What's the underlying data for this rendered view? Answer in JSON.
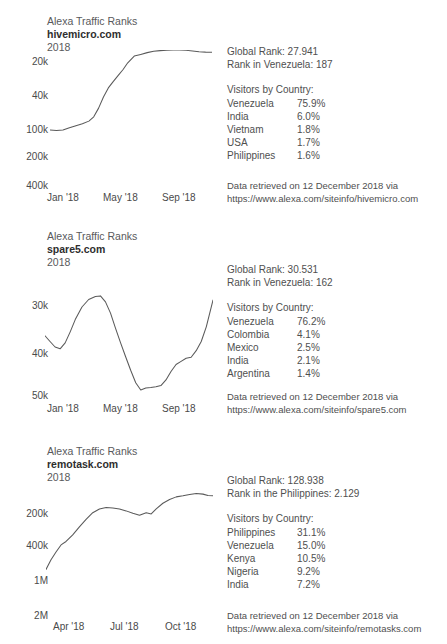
{
  "page": {
    "background": "#ffffff",
    "line_color": "#5a5a5a",
    "text_color": "#4f4f4f"
  },
  "panels": [
    {
      "kicker": "Alexa Traffic Ranks",
      "site": "hivemicro.com",
      "year": "2018",
      "global_rank_label": "Global Rank: 27.941",
      "country_rank_label": "Rank in Venezuela: 187",
      "visitors_title": "Visitors by Country:",
      "visitors": [
        {
          "country": "Venezuela",
          "pct": "75.9%"
        },
        {
          "country": "India",
          "pct": "6.0%"
        },
        {
          "country": "Vietnam",
          "pct": "1.8%"
        },
        {
          "country": "USA",
          "pct": "1.7%"
        },
        {
          "country": "Philippines",
          "pct": "1.6%"
        }
      ],
      "source_line1": "Data retrieved on 12 December 2018 via",
      "source_line2": "https://www.alexa.com/siteinfo/hivemicro.com"
    },
    {
      "kicker": "Alexa Traffic Ranks",
      "site": "spare5.com",
      "year": "2018",
      "global_rank_label": "Global Rank: 30.531",
      "country_rank_label": "Rank in Venezuela: 162",
      "visitors_title": "Visitors by Country:",
      "visitors": [
        {
          "country": "Venezuela",
          "pct": "76.2%"
        },
        {
          "country": "Colombia",
          "pct": "4.1%"
        },
        {
          "country": "Mexico",
          "pct": "2.5%"
        },
        {
          "country": "India",
          "pct": "2.1%"
        },
        {
          "country": "Argentina",
          "pct": "1.4%"
        }
      ],
      "source_line1": "Data retrieved on 12 December 2018 via",
      "source_line2": "https://www.alexa.com/siteinfo/spare5.com"
    },
    {
      "kicker": "Alexa Traffic Ranks",
      "site": "remotask.com",
      "year": "2018",
      "global_rank_label": "Global Rank: 128.938",
      "country_rank_label": "Rank in the Philippines: 2.129",
      "visitors_title": "Visitors by Country:",
      "visitors": [
        {
          "country": "Philippines",
          "pct": "31.1%"
        },
        {
          "country": "Venezuela",
          "pct": "15.0%"
        },
        {
          "country": "Kenya",
          "pct": "10.5%"
        },
        {
          "country": "Nigeria",
          "pct": "9.2%"
        },
        {
          "country": "India",
          "pct": "7.2%"
        }
      ],
      "source_line1": "Data retrieved on 12 December 2018 via",
      "source_line2": "https://www.alexa.com/siteinfo/remotasks.com"
    }
  ],
  "chart_data": [
    {
      "type": "line",
      "title": "Alexa Traffic Ranks hivemicro.com 2018",
      "xlabel": "",
      "ylabel": "",
      "y_inverted": true,
      "y_scale": "log",
      "yticks": [
        "20k",
        "40k",
        "100k",
        "200k",
        "400k"
      ],
      "ytick_values": [
        20000,
        40000,
        100000,
        200000,
        400000
      ],
      "xticks": [
        "Jan '18",
        "May '18",
        "Sep '18"
      ],
      "grid": false,
      "legend": null,
      "x": [
        0.0,
        0.04,
        0.08,
        0.12,
        0.16,
        0.2,
        0.24,
        0.27,
        0.3,
        0.33,
        0.36,
        0.39,
        0.42,
        0.45,
        0.48,
        0.52,
        0.56,
        0.6,
        0.64,
        0.68,
        0.72,
        0.76,
        0.8,
        0.84,
        0.88,
        0.92,
        0.96,
        1.0
      ],
      "values": [
        250000,
        252000,
        250000,
        240000,
        232000,
        225000,
        215000,
        200000,
        160000,
        120000,
        95000,
        80000,
        68000,
        58000,
        48000,
        40000,
        33000,
        27000,
        23000,
        21500,
        20500,
        20200,
        20100,
        20800,
        22500,
        24500,
        25500,
        25800
      ]
    },
    {
      "type": "line",
      "title": "Alexa Traffic Ranks spare5.com 2018",
      "xlabel": "",
      "ylabel": "",
      "y_inverted": true,
      "y_scale": "log",
      "yticks": [
        "30k",
        "40k",
        "50k"
      ],
      "ytick_values": [
        30000,
        40000,
        50000
      ],
      "xticks": [
        "Jan '18",
        "May '18",
        "Sep '18"
      ],
      "grid": false,
      "legend": null,
      "x": [
        0.0,
        0.03,
        0.06,
        0.09,
        0.12,
        0.15,
        0.18,
        0.22,
        0.26,
        0.3,
        0.33,
        0.36,
        0.39,
        0.42,
        0.45,
        0.48,
        0.51,
        0.54,
        0.57,
        0.6,
        0.63,
        0.66,
        0.69,
        0.72,
        0.75,
        0.78,
        0.81,
        0.84,
        0.87,
        0.9,
        0.93,
        0.96,
        1.0
      ],
      "values": [
        37000,
        38200,
        39400,
        39800,
        38500,
        36200,
        33800,
        31500,
        30200,
        29700,
        29600,
        30600,
        32600,
        35500,
        38500,
        41500,
        44500,
        47500,
        49300,
        48800,
        48700,
        48500,
        48200,
        46800,
        44800,
        43200,
        42500,
        41800,
        41600,
        40200,
        38200,
        35200,
        30300
      ]
    },
    {
      "type": "line",
      "title": "Alexa Traffic Ranks remotask.com 2018",
      "xlabel": "",
      "ylabel": "",
      "y_inverted": true,
      "y_scale": "log",
      "yticks": [
        "200k",
        "400k",
        "1M",
        "2M"
      ],
      "ytick_values": [
        200000,
        400000,
        1000000,
        2000000
      ],
      "xticks": [
        "Apr '18",
        "Jul '18",
        "Oct '18"
      ],
      "grid": false,
      "legend": null,
      "x": [
        0.0,
        0.03,
        0.06,
        0.09,
        0.12,
        0.16,
        0.2,
        0.24,
        0.28,
        0.32,
        0.36,
        0.4,
        0.44,
        0.48,
        0.52,
        0.56,
        0.6,
        0.63,
        0.66,
        0.7,
        0.74,
        0.78,
        0.82,
        0.86,
        0.9,
        0.94,
        0.97,
        1.0
      ],
      "values": [
        1050000,
        800000,
        640000,
        520000,
        470000,
        390000,
        320000,
        265000,
        225000,
        205000,
        198000,
        200000,
        205000,
        215000,
        228000,
        240000,
        225000,
        232000,
        205000,
        178000,
        162000,
        152000,
        148000,
        143000,
        140000,
        142000,
        147000,
        148000
      ]
    }
  ]
}
